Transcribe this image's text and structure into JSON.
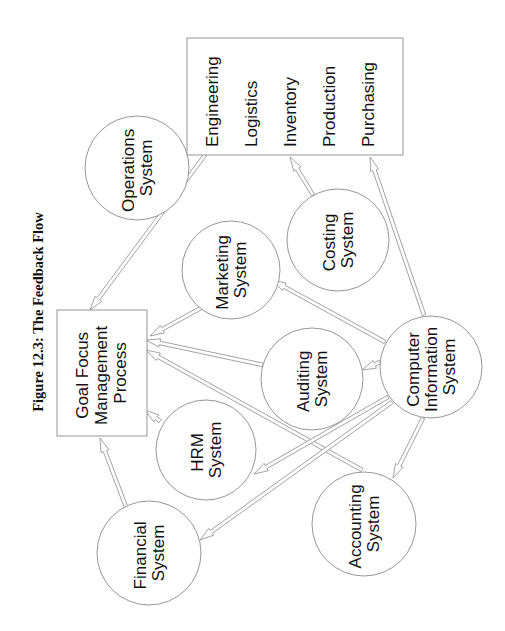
{
  "title": "Figure 12.3: The Feedback Flow",
  "colors": {
    "stroke": "#8a8a8a",
    "text": "#111111",
    "background": "#ffffff"
  },
  "nodes": {
    "goal": {
      "shape": "rectangle",
      "lines": [
        "Goal Focus",
        "Management",
        "Process"
      ]
    },
    "functions": {
      "shape": "rectangle",
      "lines": [
        "Engineering",
        "Logistics",
        "Inventory",
        "Production",
        "Purchasing"
      ]
    },
    "operations": {
      "shape": "circle",
      "lines": [
        "Operations",
        "System"
      ]
    },
    "marketing": {
      "shape": "circle",
      "lines": [
        "Marketing",
        "System"
      ]
    },
    "costing": {
      "shape": "circle",
      "lines": [
        "Costing",
        "System"
      ]
    },
    "auditing": {
      "shape": "circle",
      "lines": [
        "Auditing",
        "System"
      ]
    },
    "hrm": {
      "shape": "circle",
      "lines": [
        "HRM",
        "System"
      ]
    },
    "financial": {
      "shape": "circle",
      "lines": [
        "Financial",
        "System"
      ]
    },
    "cis": {
      "shape": "circle",
      "lines": [
        "Computer",
        "Information",
        "System"
      ]
    },
    "accounting": {
      "shape": "circle",
      "lines": [
        "Accounting",
        "System"
      ]
    }
  },
  "edges": [
    {
      "from": "functions",
      "to": "goal"
    },
    {
      "from": "marketing",
      "to": "goal"
    },
    {
      "from": "auditing",
      "to": "goal"
    },
    {
      "from": "accounting",
      "to": "goal"
    },
    {
      "from": "hrm",
      "to": "goal"
    },
    {
      "from": "financial",
      "to": "goal"
    },
    {
      "from": "costing",
      "to": "functions"
    },
    {
      "from": "cis",
      "to": "functions"
    },
    {
      "from": "cis",
      "to": "marketing"
    },
    {
      "from": "cis",
      "to": "auditing"
    },
    {
      "from": "cis",
      "to": "hrm"
    },
    {
      "from": "cis",
      "to": "financial"
    },
    {
      "from": "cis",
      "to": "accounting"
    }
  ]
}
